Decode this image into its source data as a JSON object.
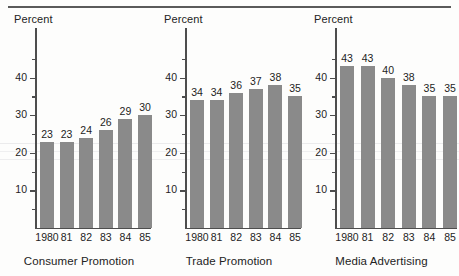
{
  "figure": {
    "axis_unit_label": "Percent",
    "bar_color": "#8a8a8a",
    "axis_color": "#4d4d4d",
    "rule_color": "#5a5a5a"
  },
  "chart_data": [
    {
      "type": "bar",
      "title": "Consumer Promotion",
      "xlabel": "",
      "ylabel": "Percent",
      "categories": [
        "1980",
        "81",
        "82",
        "83",
        "84",
        "85"
      ],
      "values": [
        23,
        23,
        24,
        26,
        29,
        30
      ],
      "ylim": [
        0,
        45
      ],
      "yticks": [
        10,
        20,
        30,
        40
      ],
      "ytick_labels": [
        "10",
        "20",
        "30",
        "40"
      ],
      "yminor_ticks": [
        5,
        15,
        25,
        35,
        45
      ],
      "grid": false,
      "legend": "none"
    },
    {
      "type": "bar",
      "title": "Trade Promotion",
      "xlabel": "",
      "ylabel": "Percent",
      "categories": [
        "1980",
        "81",
        "82",
        "83",
        "84",
        "85"
      ],
      "values": [
        34,
        34,
        36,
        37,
        38,
        35
      ],
      "ylim": [
        0,
        45
      ],
      "yticks": [
        10,
        20,
        30,
        40
      ],
      "ytick_labels": [
        "10",
        "20",
        "30",
        "40"
      ],
      "yminor_ticks": [
        5,
        15,
        25,
        35,
        45
      ],
      "grid": false,
      "legend": "none"
    },
    {
      "type": "bar",
      "title": "Media Advertising",
      "xlabel": "",
      "ylabel": "Percent",
      "categories": [
        "1980",
        "81",
        "82",
        "83",
        "84",
        "85"
      ],
      "values": [
        43,
        43,
        40,
        38,
        35,
        35
      ],
      "ylim": [
        0,
        45
      ],
      "yticks": [
        10,
        20,
        30,
        40
      ],
      "ytick_labels": [
        "10",
        "20",
        "30",
        "40"
      ],
      "yminor_ticks": [
        5,
        15,
        25,
        35,
        45
      ],
      "grid": false,
      "legend": "none"
    }
  ]
}
